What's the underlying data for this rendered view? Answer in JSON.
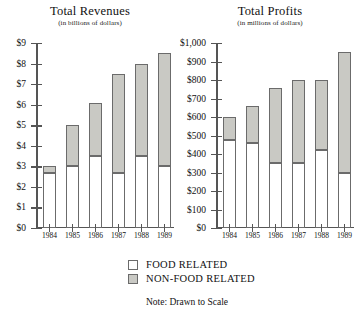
{
  "legend": {
    "items": [
      {
        "label": "FOOD RELATED",
        "key": "food",
        "color": "#ffffff"
      },
      {
        "label": "NON-FOOD RELATED",
        "key": "nonfood",
        "color": "#c9c9c4"
      }
    ]
  },
  "note": "Note: Drawn to Scale",
  "chart_data": [
    {
      "type": "bar",
      "stacked": true,
      "title": "Total Revenues",
      "subtitle": "(in billions of dollars)",
      "xlabel": "",
      "ylabel": "",
      "categories": [
        "1984",
        "1985",
        "1986",
        "1987",
        "1988",
        "1989"
      ],
      "ytick_labels": [
        "$0",
        "$1",
        "$2",
        "$3",
        "$4",
        "$5",
        "$6",
        "$7",
        "$8",
        "$9"
      ],
      "ytick_values": [
        0,
        1,
        2,
        3,
        4,
        5,
        6,
        7,
        8,
        9
      ],
      "ylim": [
        0,
        9
      ],
      "grid": false,
      "legend_position": "below",
      "series": [
        {
          "name": "FOOD RELATED",
          "key": "food",
          "color": "#ffffff",
          "values": [
            2.7,
            3.0,
            3.5,
            2.7,
            3.5,
            3.0
          ]
        },
        {
          "name": "NON-FOOD RELATED",
          "key": "nonfood",
          "color": "#c9c9c4",
          "values": [
            0.3,
            2.0,
            2.6,
            4.8,
            4.5,
            5.5
          ]
        }
      ],
      "totals": [
        3.0,
        5.0,
        6.1,
        7.5,
        8.0,
        8.5
      ]
    },
    {
      "type": "bar",
      "stacked": true,
      "title": "Total Profits",
      "subtitle": "(in millions of dollars)",
      "xlabel": "",
      "ylabel": "",
      "categories": [
        "1984",
        "1985",
        "1986",
        "1987",
        "1988",
        "1989"
      ],
      "ytick_labels": [
        "$0",
        "$100",
        "$200",
        "$300",
        "$400",
        "$500",
        "$600",
        "$700",
        "$800",
        "$900",
        "$1,000"
      ],
      "ytick_values": [
        0,
        100,
        200,
        300,
        400,
        500,
        600,
        700,
        800,
        900,
        1000
      ],
      "ylim": [
        0,
        1000
      ],
      "grid": false,
      "legend_position": "below",
      "series": [
        {
          "name": "FOOD RELATED",
          "key": "food",
          "color": "#ffffff",
          "values": [
            475,
            460,
            350,
            350,
            420,
            300
          ]
        },
        {
          "name": "NON-FOOD RELATED",
          "key": "nonfood",
          "color": "#c9c9c4",
          "values": [
            125,
            200,
            405,
            450,
            380,
            650
          ]
        }
      ],
      "totals": [
        600,
        660,
        755,
        800,
        800,
        950
      ]
    }
  ]
}
